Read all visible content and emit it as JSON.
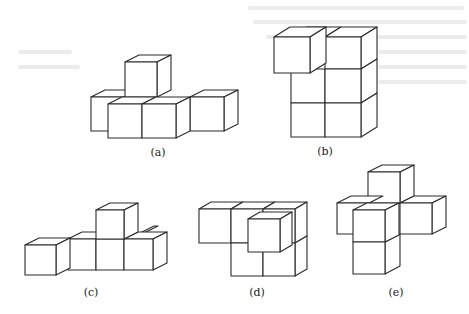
{
  "figure": {
    "panels": [
      {
        "id": "a",
        "label": "(a)",
        "label_pos": [
          158,
          156
        ]
      },
      {
        "id": "b",
        "label": "(b)",
        "label_pos": [
          325,
          155
        ]
      },
      {
        "id": "c",
        "label": "(c)",
        "label_pos": [
          91,
          296
        ]
      },
      {
        "id": "d",
        "label": "(d)",
        "label_pos": [
          257,
          296
        ]
      },
      {
        "id": "e",
        "label": "(e)",
        "label_pos": [
          396,
          296
        ]
      }
    ]
  },
  "colors": {
    "stroke": "#2a2a2a",
    "background": "#ffffff",
    "ghost_text": "#e6e6e6"
  }
}
